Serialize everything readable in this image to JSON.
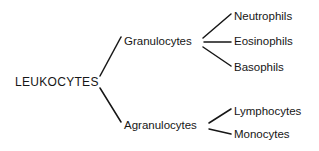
{
  "diagram": {
    "background_color": "#ffffff",
    "line_color": "#161616",
    "text_color": "#161616",
    "root": {
      "label": "LEUKOCYTES",
      "x": 15,
      "y": 82
    },
    "branches": [
      {
        "label": "Granulocytes",
        "x": 124,
        "y": 42,
        "children": [
          {
            "label": "Neutrophils",
            "x": 234,
            "y": 17
          },
          {
            "label": "Eosinophils",
            "x": 234,
            "y": 42
          },
          {
            "label": "Basophils",
            "x": 234,
            "y": 68
          }
        ]
      },
      {
        "label": "Agranulocytes",
        "x": 124,
        "y": 126,
        "children": [
          {
            "label": "Lymphocytes",
            "x": 234,
            "y": 112
          },
          {
            "label": "Monocytes",
            "x": 234,
            "y": 135
          }
        ]
      }
    ],
    "connectors": [
      {
        "name": "root-to-granulocytes",
        "x1": 100,
        "y1": 76,
        "x2": 121,
        "y2": 37
      },
      {
        "name": "root-to-agranulocytes",
        "x1": 100,
        "y1": 88,
        "x2": 121,
        "y2": 122
      },
      {
        "name": "granulocytes-to-neutrophils",
        "x1": 203,
        "y1": 38,
        "x2": 231,
        "y2": 14
      },
      {
        "name": "granulocytes-to-eosinophils",
        "x1": 204,
        "y1": 42,
        "x2": 231,
        "y2": 42
      },
      {
        "name": "granulocytes-to-basophils",
        "x1": 203,
        "y1": 47,
        "x2": 231,
        "y2": 66
      },
      {
        "name": "agranulocytes-to-lymphocytes",
        "x1": 209,
        "y1": 123,
        "x2": 231,
        "y2": 109
      },
      {
        "name": "agranulocytes-to-monocytes",
        "x1": 209,
        "y1": 129,
        "x2": 231,
        "y2": 134
      }
    ]
  }
}
